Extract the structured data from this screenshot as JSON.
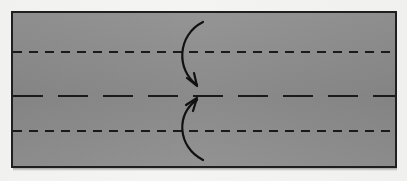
{
  "figure": {
    "caption": ""
  },
  "colors": {
    "background": "#f4f4f2",
    "paper_fill": "#8b8b8b",
    "paper_border": "#1f1f1f",
    "crease_line": "#1a1a1a",
    "arrow": "#111111"
  },
  "chart_data": {
    "type": "diagram",
    "canvas": {
      "width": 407,
      "height": 181
    },
    "paper": {
      "shape": "rectangle",
      "x": 11,
      "y": 11,
      "width": 386,
      "height": 157,
      "fill": "#8b8b8b",
      "stroke": "#1f1f1f",
      "stroke_width": 2
    },
    "crease_lines": [
      {
        "name": "upper-valley-crease",
        "orientation": "horizontal",
        "y": 52,
        "x_start": 13,
        "x_end": 395,
        "style": "dashed",
        "dash_length": 9,
        "gap_length": 7,
        "stroke_width": 1.9
      },
      {
        "name": "center-crease",
        "orientation": "horizontal",
        "y": 96,
        "x_start": 13,
        "x_end": 395,
        "style": "long-dashed",
        "dash_length": 30,
        "gap_length": 15,
        "stroke_width": 1.9
      },
      {
        "name": "lower-valley-crease",
        "orientation": "horizontal",
        "y": 131,
        "x_start": 13,
        "x_end": 395,
        "style": "dashed",
        "dash_length": 9,
        "gap_length": 7,
        "stroke_width": 1.9
      }
    ],
    "arrows": [
      {
        "name": "fold-down-arrow",
        "direction": "down",
        "tail": [
          203,
          22
        ],
        "head": [
          197,
          85
        ],
        "control_points": [
          [
            177,
            35
          ],
          [
            176,
            70
          ]
        ],
        "arrowhead_size": 9,
        "stroke_width": 2.2
      },
      {
        "name": "fold-up-arrow",
        "direction": "up",
        "tail": [
          203,
          160
        ],
        "head": [
          197,
          100
        ],
        "control_points": [
          [
            177,
            147
          ],
          [
            176,
            113
          ]
        ],
        "arrowhead_size": 9,
        "stroke_width": 2.2
      }
    ],
    "legend": [],
    "annotations": []
  }
}
